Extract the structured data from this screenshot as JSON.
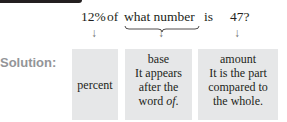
{
  "question": {
    "percent": "12%",
    "of": "of",
    "what_number": "what number",
    "is": "is",
    "amount": "47?"
  },
  "arrows": [
    "↓",
    "↓",
    "↓"
  ],
  "solution_label": "Solution:",
  "boxes": {
    "percent": {
      "lines": [
        "percent"
      ]
    },
    "base": {
      "title": "base",
      "lines": [
        "It appears",
        "after the",
        "word "
      ],
      "italic_word": "of",
      "end": "."
    },
    "amount": {
      "title": "amount",
      "lines": [
        "It is the part",
        "compared to",
        "the whole."
      ]
    }
  }
}
